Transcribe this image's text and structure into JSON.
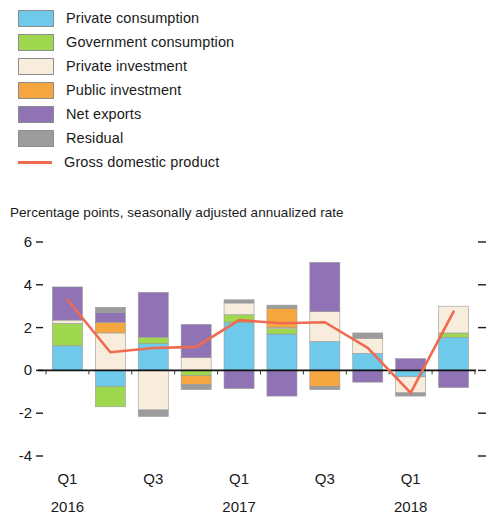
{
  "legend": {
    "items": [
      {
        "label": "Private consumption",
        "color": "#6ec9ea",
        "type": "swatch",
        "key": "private_consumption"
      },
      {
        "label": "Government consumption",
        "color": "#9fd84f",
        "type": "swatch",
        "key": "government_consumption"
      },
      {
        "label": "Private investment",
        "color": "#f8ecdc",
        "type": "swatch",
        "key": "private_investment"
      },
      {
        "label": "Public investment",
        "color": "#f6a63f",
        "type": "swatch",
        "key": "public_investment"
      },
      {
        "label": "Net exports",
        "color": "#8f73b5",
        "type": "swatch",
        "key": "net_exports"
      },
      {
        "label": "Residual",
        "color": "#9c9c9c",
        "type": "swatch",
        "key": "residual"
      },
      {
        "label": "Gross domestic product",
        "color": "#ef6a4e",
        "type": "line",
        "key": "gdp"
      }
    ]
  },
  "subtitle": "Percentage points, seasonally adjusted annualized rate",
  "chart_data": {
    "type": "bar",
    "title": "",
    "subtitle": "Percentage points, seasonally adjusted annualized rate",
    "xlabel": "",
    "ylabel": "Percentage points, seasonally adjusted annualized rate",
    "stacked": true,
    "grid": false,
    "legend_position": "top-left",
    "ylim": [
      -4,
      6
    ],
    "yticks": [
      -4,
      -2,
      0,
      2,
      4,
      6
    ],
    "ytick_labels": [
      "-4",
      "-2",
      "0",
      "2",
      "4",
      "6"
    ],
    "categories": [
      "Q1 2016",
      "Q2 2016",
      "Q3 2016",
      "Q4 2016",
      "Q1 2017",
      "Q2 2017",
      "Q3 2017",
      "Q4 2017",
      "Q1 2018",
      "Q2 2018"
    ],
    "xtick_labels": [
      {
        "quarter": "Q1",
        "year": "2016",
        "index": 0
      },
      {
        "quarter": "Q3",
        "year": "",
        "index": 2
      },
      {
        "quarter": "Q1",
        "year": "2017",
        "index": 4
      },
      {
        "quarter": "Q3",
        "year": "",
        "index": 6
      },
      {
        "quarter": "Q1",
        "year": "2018",
        "index": 8
      }
    ],
    "series": [
      {
        "name": "Private consumption",
        "color": "#6ec9ea",
        "values": [
          1.15,
          -0.75,
          1.25,
          0.0,
          2.25,
          1.7,
          1.35,
          0.8,
          -0.3,
          1.55
        ]
      },
      {
        "name": "Government consumption",
        "color": "#9fd84f",
        "values": [
          1.05,
          -0.95,
          0.3,
          -0.25,
          0.35,
          0.25,
          0.0,
          0.0,
          0.0,
          0.2
        ]
      },
      {
        "name": "Private investment",
        "color": "#f8ecdc",
        "values": [
          0.15,
          1.75,
          -1.85,
          0.6,
          0.55,
          0.05,
          1.4,
          0.7,
          -0.75,
          1.25
        ]
      },
      {
        "name": "Public investment",
        "color": "#f6a63f",
        "values": [
          0.0,
          0.5,
          0.0,
          -0.4,
          0.0,
          0.9,
          -0.75,
          0.0,
          0.0,
          0.0
        ]
      },
      {
        "name": "Net exports",
        "color": "#8f73b5",
        "values": [
          1.55,
          0.45,
          2.1,
          1.55,
          -0.85,
          -1.2,
          2.3,
          -0.55,
          0.55,
          -0.8
        ]
      },
      {
        "name": "Residual",
        "color": "#9c9c9c",
        "values": [
          0.0,
          0.25,
          -0.3,
          -0.25,
          0.15,
          0.15,
          -0.15,
          0.25,
          -0.15,
          0.0
        ]
      }
    ],
    "line_series": {
      "name": "Gross domestic product",
      "color": "#ef6a4e",
      "values": [
        3.3,
        0.85,
        1.05,
        1.1,
        2.35,
        2.2,
        2.25,
        1.05,
        -1.05,
        2.75
      ]
    }
  }
}
